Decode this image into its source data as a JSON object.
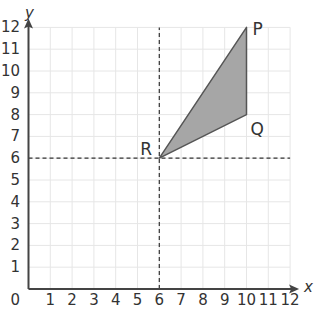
{
  "diagram": {
    "type": "coordinate-grid",
    "x_axis": {
      "label": "x",
      "min": 0,
      "max": 12,
      "ticks": [
        "1",
        "2",
        "3",
        "4",
        "5",
        "6",
        "7",
        "8",
        "9",
        "10",
        "11",
        "12"
      ]
    },
    "y_axis": {
      "label": "y",
      "min": 0,
      "max": 12,
      "ticks": [
        "1",
        "2",
        "3",
        "4",
        "5",
        "6",
        "7",
        "8",
        "9",
        "10",
        "11",
        "12"
      ]
    },
    "origin_label": "0",
    "points": [
      {
        "name": "P",
        "x": 10,
        "y": 12
      },
      {
        "name": "Q",
        "x": 10,
        "y": 8
      },
      {
        "name": "R",
        "x": 6,
        "y": 6
      }
    ],
    "triangle": {
      "vertices": [
        "P",
        "Q",
        "R"
      ],
      "fill": "#a6a6a6",
      "stroke": "#555555"
    },
    "dashed_lines": [
      {
        "orientation": "vertical",
        "x": 6
      },
      {
        "orientation": "horizontal",
        "y": 6
      }
    ],
    "colors": {
      "grid": "#e6e6e6",
      "axis": "#444444",
      "text": "#333333"
    }
  }
}
